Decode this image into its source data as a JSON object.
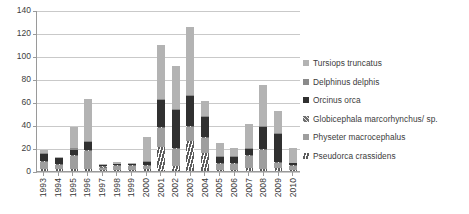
{
  "chart_data": {
    "type": "bar",
    "stacked": true,
    "title": "",
    "xlabel": "",
    "ylabel": "",
    "ylim": [
      0,
      140
    ],
    "yticks": [
      0,
      20,
      40,
      60,
      80,
      100,
      120,
      140
    ],
    "grid": true,
    "legend_position": "right",
    "categories": [
      "1993",
      "1994",
      "1995",
      "1996",
      "1997",
      "1998",
      "1999",
      "2000",
      "2001",
      "2002",
      "2003",
      "2004",
      "2005",
      "2006",
      "2007",
      "2008",
      "2009",
      "2010"
    ],
    "series": [
      {
        "name": "Tursiops truncatus",
        "color": "#b3b3b3",
        "pattern": "solid",
        "values": [
          2,
          1,
          18,
          37,
          1,
          2,
          1,
          21,
          47,
          37,
          59,
          13,
          11,
          7,
          21,
          36,
          19,
          13
        ]
      },
      {
        "name": "Delphinus delphis",
        "color": "#8a8a8a",
        "pattern": "solid",
        "values": [
          1,
          0,
          2,
          1,
          0,
          0,
          0,
          1,
          1,
          1,
          1,
          1,
          1,
          1,
          1,
          1,
          1,
          0
        ]
      },
      {
        "name": "Orcinus orca",
        "color": "#303030",
        "pattern": "solid",
        "values": [
          6,
          5,
          4,
          7,
          1,
          1,
          1,
          3,
          24,
          33,
          26,
          17,
          5,
          5,
          5,
          19,
          24,
          2
        ]
      },
      {
        "name": "Globicephala marcorhynchus/ sp.",
        "color": "#6f6f6f",
        "pattern": "hatch-45",
        "values": [
          1,
          1,
          1,
          1,
          1,
          1,
          1,
          1,
          1,
          1,
          1,
          1,
          1,
          1,
          1,
          1,
          1,
          1
        ]
      },
      {
        "name": "Physeter macrocephalus",
        "color": "#9e9e9e",
        "pattern": "solid",
        "values": [
          6,
          3,
          11,
          15,
          2,
          3,
          3,
          2,
          16,
          15,
          12,
          13,
          5,
          5,
          10,
          16,
          4,
          3
        ]
      },
      {
        "name": "Pseudorca crassidens",
        "color": "#6a6a6a",
        "pattern": "vertical-stripe",
        "values": [
          2,
          2,
          2,
          2,
          1,
          1,
          1,
          2,
          21,
          4,
          26,
          16,
          1,
          1,
          3,
          2,
          3,
          1
        ]
      }
    ],
    "totals": [
      18,
      12,
      38,
      63,
      6,
      8,
      7,
      30,
      110,
      91,
      125,
      61,
      24,
      20,
      41,
      75,
      52,
      20
    ]
  },
  "legend": {
    "items": [
      {
        "label": "Tursiops truncatus"
      },
      {
        "label": "Delphinus delphis"
      },
      {
        "label": "Orcinus orca"
      },
      {
        "label": "Globicephala marcorhynchus/ sp."
      },
      {
        "label": "Physeter macrocephalus"
      },
      {
        "label": "Pseudorca crassidens"
      }
    ]
  }
}
